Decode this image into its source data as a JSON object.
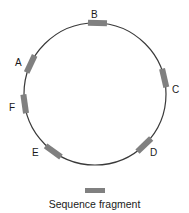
{
  "figure": {
    "type": "circular-sequence-map",
    "title": "",
    "background_color": "#ffffff"
  },
  "circle": {
    "center_x": 95,
    "center_y": 94,
    "radius": 71,
    "stroke_color": "#3a3a3a",
    "stroke_width": 1.2,
    "fill": "none"
  },
  "fragment_style": {
    "color": "#808080",
    "length": 19,
    "thickness": 6
  },
  "fragments": [
    {
      "id": "A",
      "label": "A",
      "angle_deg": 205,
      "label_x": 15,
      "label_y": 58,
      "color": "#808080"
    },
    {
      "id": "B",
      "label": "B",
      "angle_deg": 272,
      "label_x": 91,
      "label_y": 10,
      "color": "#808080"
    },
    {
      "id": "C",
      "label": "C",
      "angle_deg": 347,
      "label_x": 172,
      "label_y": 85,
      "color": "#808080"
    },
    {
      "id": "D",
      "label": "D",
      "angle_deg": 46,
      "label_x": 150,
      "label_y": 148,
      "color": "#808080"
    },
    {
      "id": "E",
      "label": "E",
      "angle_deg": 126,
      "label_x": 32,
      "label_y": 148,
      "color": "#808080"
    },
    {
      "id": "F",
      "label": "F",
      "angle_deg": 172,
      "label_x": 9,
      "label_y": 103,
      "color": "#808080"
    }
  ],
  "legend": {
    "caption": "Sequence fragment",
    "swatch": {
      "x": 85,
      "y": 188,
      "width": 20,
      "height": 5,
      "color": "#808080"
    }
  }
}
